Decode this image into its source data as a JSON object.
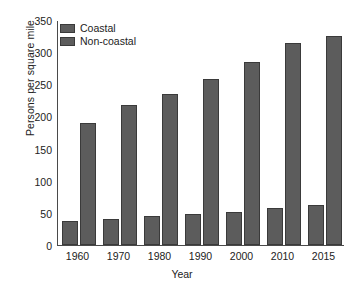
{
  "chart_data": {
    "type": "bar",
    "title": "",
    "xlabel": "Year",
    "ylabel": "Persons per square mile",
    "categories": [
      "1960",
      "1970",
      "1980",
      "1990",
      "2000",
      "2010",
      "2015"
    ],
    "series": [
      {
        "name": "Coastal",
        "values": [
          38,
          41,
          45,
          48,
          52,
          58,
          62
        ],
        "color": "#5c5c5c"
      },
      {
        "name": "Non-coastal",
        "values": [
          190,
          218,
          235,
          259,
          285,
          315,
          325
        ],
        "color": "#5c5c5c"
      }
    ],
    "ylim": [
      0,
      350
    ],
    "yticks": [
      0,
      50,
      100,
      150,
      200,
      250,
      300,
      350
    ],
    "ytick_labels": [
      "0",
      "50",
      "100",
      "150",
      "200",
      "250",
      "300",
      "350"
    ],
    "grid": false,
    "legend_position": "top-left",
    "legend_entries": [
      "Coastal",
      "Non-coastal"
    ]
  },
  "axes": {
    "y_title": "Persons per square mile",
    "x_title": "Year"
  },
  "legend": {
    "items": [
      {
        "label": "Coastal"
      },
      {
        "label": "Non-coastal"
      }
    ]
  }
}
